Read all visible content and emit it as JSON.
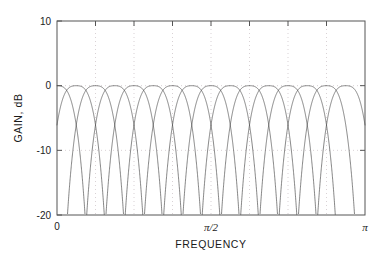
{
  "chart_data": {
    "type": "line",
    "title": "",
    "xlabel": "FREQUENCY",
    "ylabel": "GAIN, dB",
    "xlim": [
      0,
      3.141592653589793
    ],
    "ylim": [
      -20,
      10
    ],
    "grid": true,
    "legend": null,
    "legend_position": "none",
    "x_tick_labels": [
      "0",
      "π/2",
      "π"
    ],
    "x_tick_values": [
      0,
      1.5707963267948966,
      3.141592653589793
    ],
    "x_minor_tick_count": 7,
    "y_tick_labels": [
      "10",
      "0",
      "-10",
      "-20"
    ],
    "y_tick_values": [
      10,
      0,
      -10,
      -20
    ],
    "num_channels": 16,
    "passband_crossover_db": -3.0,
    "peak_gain_db": 0.0,
    "first_sidelobe_db": -13.3,
    "series": [
      {
        "name": "Channel 0",
        "center": 0.0
      },
      {
        "name": "Channel 1",
        "center": 0.19634954
      },
      {
        "name": "Channel 2",
        "center": 0.39269908
      },
      {
        "name": "Channel 3",
        "center": 0.58904862
      },
      {
        "name": "Channel 4",
        "center": 0.78539816
      },
      {
        "name": "Channel 5",
        "center": 0.9817477
      },
      {
        "name": "Channel 6",
        "center": 1.17809725
      },
      {
        "name": "Channel 7",
        "center": 1.37444679
      },
      {
        "name": "Channel 8",
        "center": 1.57079633
      },
      {
        "name": "Channel 9",
        "center": 1.76714587
      },
      {
        "name": "Channel 10",
        "center": 1.96349541
      },
      {
        "name": "Channel 11",
        "center": 2.15984495
      },
      {
        "name": "Channel 12",
        "center": 2.35619449
      },
      {
        "name": "Channel 13",
        "center": 2.55254403
      },
      {
        "name": "Channel 14",
        "center": 2.74889357
      },
      {
        "name": "Channel 15",
        "center": 2.94524311
      }
    ]
  },
  "axes": {
    "x_ticks": [
      {
        "label": "0",
        "value": 0
      },
      {
        "label": "π/2",
        "value": 1.5707963267948966
      },
      {
        "label": "π",
        "value": 3.141592653589793
      }
    ],
    "y_ticks": [
      {
        "label": "10",
        "value": 10
      },
      {
        "label": "0",
        "value": 0
      },
      {
        "label": "-10",
        "value": -10
      },
      {
        "label": "-20",
        "value": -20
      }
    ],
    "x_title": "FREQUENCY",
    "y_title": "GAIN, dB"
  }
}
